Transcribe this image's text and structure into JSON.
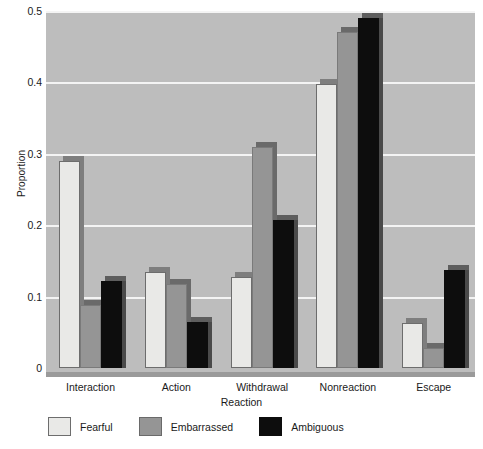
{
  "chart_data": {
    "type": "bar",
    "title": "",
    "xlabel": "Reaction",
    "ylabel": "Proportion",
    "categories": [
      "Interaction",
      "Action",
      "Withdrawal",
      "Nonreaction",
      "Escape"
    ],
    "series": [
      {
        "name": "Fearful",
        "color": "#e9e9e7",
        "values": [
          0.29,
          0.135,
          0.127,
          0.398,
          0.063
        ]
      },
      {
        "name": "Embarrassed",
        "color": "#959595",
        "values": [
          0.088,
          0.118,
          0.31,
          0.47,
          0.028
        ]
      },
      {
        "name": "Ambiguous",
        "color": "#0d0d0d",
        "values": [
          0.122,
          0.065,
          0.207,
          0.49,
          0.137
        ]
      }
    ],
    "ylim": [
      0,
      0.5
    ],
    "yticks": [
      0,
      0.1,
      0.2,
      0.3,
      0.4,
      0.5
    ],
    "ytick_labels": [
      "0",
      "0.1",
      "0.2",
      "0.3",
      "0.4",
      "0.5"
    ],
    "grid": true,
    "grid_color": "#f4f4f4",
    "plot_background": "#bdbdbd",
    "legend_position": "below-axes"
  }
}
